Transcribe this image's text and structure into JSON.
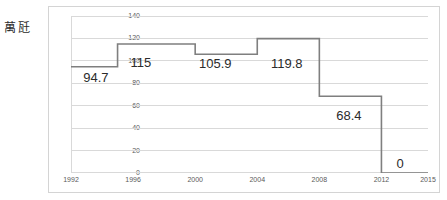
{
  "axis_unit_label": "萬瓩",
  "colors": {
    "line": "#7f7f7f",
    "grid": "#d9d9d9",
    "frame": "#d4d4d4",
    "tick_text": "#5a5a5a",
    "label_text": "#2b2b2b",
    "background": "#ffffff"
  },
  "chart_data": {
    "type": "line",
    "title": "",
    "subtitle": "",
    "xlabel": "",
    "ylabel": "萬瓩",
    "xlim": [
      1992,
      2015
    ],
    "ylim": [
      0,
      140
    ],
    "grid": true,
    "grid_axis": "y",
    "legend": false,
    "legend_position": "none",
    "step_style": "post",
    "y_ticks": [
      0,
      20,
      40,
      60,
      80,
      100,
      120,
      140
    ],
    "y_tick_labels": [
      "0",
      "20",
      "40",
      "60",
      "80",
      "100",
      "120",
      "140"
    ],
    "x_ticks": [
      1992,
      1993,
      1994,
      1995,
      1996,
      1997,
      1998,
      1999,
      2000,
      2001,
      2002,
      2003,
      2004,
      2005,
      2006,
      2007,
      2008,
      2009,
      2010,
      2011,
      2012,
      2013,
      2014,
      2015
    ],
    "x_tick_labels": [
      {
        "x": 1992,
        "label": "1992"
      },
      {
        "x": 1996,
        "label": "1996"
      },
      {
        "x": 2000,
        "label": "2000"
      },
      {
        "x": 2004,
        "label": "2004"
      },
      {
        "x": 2008,
        "label": "2008"
      },
      {
        "x": 2012,
        "label": "2012"
      },
      {
        "x": 2015,
        "label": "2015"
      }
    ],
    "series": [
      {
        "name": "",
        "steps": [
          {
            "x_start": 1992,
            "x_end": 1995,
            "value": 94.7
          },
          {
            "x_start": 1995,
            "x_end": 2000,
            "value": 115
          },
          {
            "x_start": 2000,
            "x_end": 2004,
            "value": 105.9
          },
          {
            "x_start": 2004,
            "x_end": 2008,
            "value": 119.8
          },
          {
            "x_start": 2008,
            "x_end": 2012,
            "value": 68.4
          },
          {
            "x_start": 2012,
            "x_end": 2015,
            "value": 0
          }
        ],
        "values": [
          94.7,
          115,
          105.9,
          119.8,
          68.4,
          0
        ]
      }
    ],
    "annotations": [
      {
        "text": "94.7",
        "x": 1993.6,
        "y": 85.5
      },
      {
        "text": "115",
        "x": 1996.5,
        "y": 99.0
      },
      {
        "text": "105.9",
        "x": 2001.3,
        "y": 98.5
      },
      {
        "text": "119.8",
        "x": 2005.9,
        "y": 98.5
      },
      {
        "text": "68.4",
        "x": 2009.9,
        "y": 52.0
      },
      {
        "text": "0",
        "x": 2013.2,
        "y": 9.0
      }
    ]
  }
}
